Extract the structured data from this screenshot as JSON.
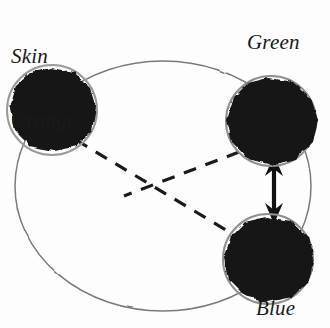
{
  "figure": {
    "background_color": "#fdfdfd",
    "ink_color": "#141414",
    "arc_color": "#6e6e6e"
  },
  "nodes": [
    {
      "id": "skin-orange",
      "label": "Skin\nOrange",
      "label_line1": "Skin",
      "label_line2": "Orange",
      "color_name": "Skin Orange",
      "fill": "#141414",
      "cx": 52,
      "cy": 110,
      "r": 47
    },
    {
      "id": "green",
      "label": "Green",
      "color_name": "Green",
      "fill": "#141414",
      "cx": 271,
      "cy": 121,
      "r": 48
    },
    {
      "id": "blue",
      "label": "Blue",
      "color_name": "Blue",
      "fill": "#141414",
      "cx": 268,
      "cy": 259,
      "r": 47
    }
  ],
  "connections": [
    {
      "id": "arc-circle",
      "style": "solid-thin-arc",
      "description": "large thin circle passing through all three nodes",
      "arrows": "none"
    },
    {
      "id": "skin-orange-to-blue",
      "from": "skin-orange",
      "to": "blue",
      "style": "dashed",
      "arrows": "none"
    },
    {
      "id": "green-to-lower-left",
      "from": "green",
      "to": "skin-orange",
      "style": "dashed",
      "arrows": "none"
    },
    {
      "id": "green-blue-arrow",
      "from": "green",
      "to": "blue",
      "style": "solid-thick",
      "arrows": "double"
    }
  ]
}
